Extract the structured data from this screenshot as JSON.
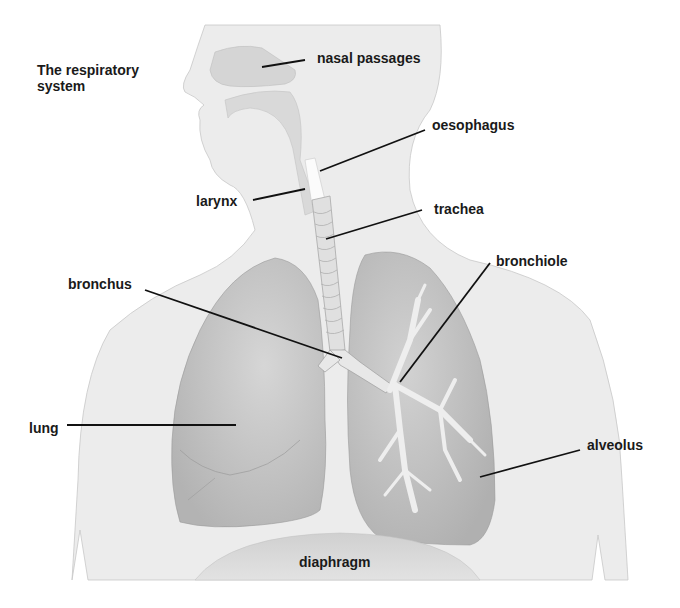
{
  "title": "The respiratory\nsystem",
  "title_lines": [
    "The respiratory",
    "system"
  ],
  "labels": {
    "nasal_passages": "nasal passages",
    "oesophagus": "oesophagus",
    "larynx": "larynx",
    "trachea": "trachea",
    "bronchus": "bronchus",
    "bronchiole": "bronchiole",
    "lung": "lung",
    "alveolus": "alveolus",
    "diaphragm": "diaphragm"
  },
  "colors": {
    "background": "#ffffff",
    "body": "#ececec",
    "lung": "#c9c9c9",
    "lung_dark": "#b5b5b5",
    "airway": "#e6e6e6",
    "leader_line": "#111111",
    "text": "#1a1a1a"
  }
}
